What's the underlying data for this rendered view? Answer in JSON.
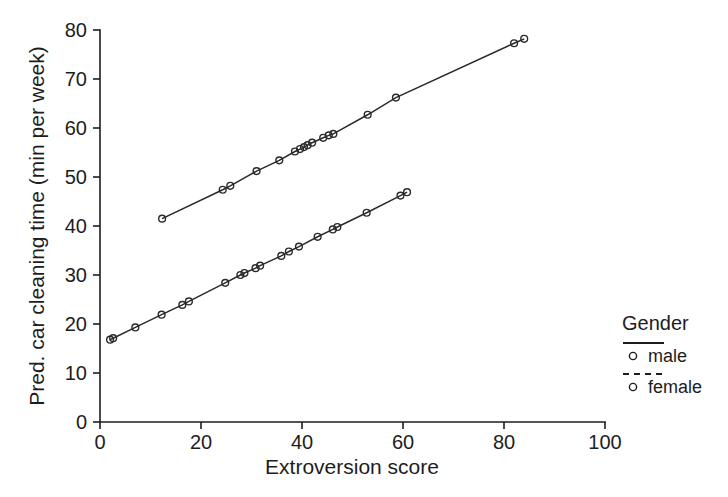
{
  "chart_data": {
    "type": "scatter",
    "title": "",
    "xlabel": "Extroversion score",
    "ylabel": "Pred. car cleaning time (min per week)",
    "xlim": [
      0,
      100
    ],
    "ylim": [
      0,
      80
    ],
    "xticks": [
      0,
      20,
      40,
      60,
      80,
      100
    ],
    "yticks": [
      0,
      10,
      20,
      30,
      40,
      50,
      60,
      70,
      80
    ],
    "grid": false,
    "legend_position": "right",
    "legend_title": "Gender",
    "series": [
      {
        "name": "male",
        "linestyle": "solid",
        "marker": "circle-open",
        "points": [
          [
            12.3,
            41.5
          ],
          [
            24.3,
            47.4
          ],
          [
            25.8,
            48.2
          ],
          [
            31.0,
            51.2
          ],
          [
            35.5,
            53.4
          ],
          [
            38.6,
            55.2
          ],
          [
            39.6,
            55.7
          ],
          [
            40.4,
            56.1
          ],
          [
            41.1,
            56.5
          ],
          [
            42.0,
            57.0
          ],
          [
            44.2,
            58.0
          ],
          [
            45.3,
            58.5
          ],
          [
            46.2,
            58.8
          ],
          [
            53.0,
            62.7
          ],
          [
            58.6,
            66.2
          ],
          [
            82.0,
            77.3
          ],
          [
            84.0,
            78.2
          ]
        ]
      },
      {
        "name": "female",
        "linestyle": "dashed",
        "marker": "circle-open",
        "points": [
          [
            2.0,
            16.8
          ],
          [
            2.6,
            17.1
          ],
          [
            7.0,
            19.3
          ],
          [
            12.2,
            21.9
          ],
          [
            16.3,
            23.9
          ],
          [
            17.6,
            24.6
          ],
          [
            24.8,
            28.4
          ],
          [
            27.8,
            30.0
          ],
          [
            28.6,
            30.4
          ],
          [
            30.8,
            31.4
          ],
          [
            31.7,
            31.9
          ],
          [
            35.9,
            33.9
          ],
          [
            37.4,
            34.8
          ],
          [
            39.4,
            35.8
          ],
          [
            43.1,
            37.8
          ],
          [
            46.1,
            39.3
          ],
          [
            47.0,
            39.8
          ],
          [
            52.8,
            42.7
          ],
          [
            59.5,
            46.2
          ],
          [
            60.8,
            46.9
          ]
        ]
      }
    ]
  },
  "legend": {
    "title": "Gender",
    "entries": [
      {
        "label": "male",
        "linestyle": "solid",
        "marker": "circle-open"
      },
      {
        "label": "female",
        "linestyle": "dashed",
        "marker": "circle-open"
      }
    ]
  },
  "axes": {
    "x": {
      "title": "Extroversion score",
      "tick_labels": [
        "0",
        "20",
        "40",
        "60",
        "80",
        "100"
      ]
    },
    "y": {
      "title": "Pred. car cleaning time (min per week)",
      "tick_labels": [
        "0",
        "10",
        "20",
        "30",
        "40",
        "50",
        "60",
        "70",
        "80"
      ]
    }
  },
  "colors": {
    "ink": "#1d1d1d",
    "series": "#2a2a2a",
    "background": "#ffffff"
  }
}
